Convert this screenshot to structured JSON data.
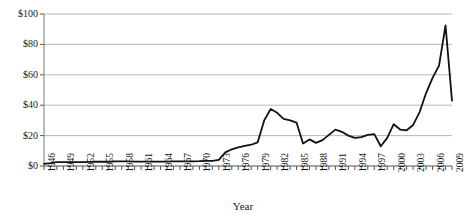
{
  "chart_data": {
    "type": "line",
    "title": "",
    "xlabel": "Year",
    "ylabel": "",
    "ylim": [
      0,
      100
    ],
    "xlim": [
      1946,
      2009
    ],
    "grid": "horizontal",
    "legend": "none",
    "y_ticks": [
      0,
      20,
      40,
      60,
      80,
      100
    ],
    "y_tick_labels": [
      "$0",
      "$20",
      "$40",
      "$60",
      "$80",
      "$100"
    ],
    "x_tick_labels": [
      "1946",
      "1949",
      "1952",
      "1955",
      "1958",
      "1961",
      "1964",
      "1967",
      "1970",
      "1973",
      "1976",
      "1979",
      "1982",
      "1985",
      "1988",
      "1991",
      "1994",
      "1997",
      "2000",
      "2003",
      "2006",
      "2009"
    ],
    "line_color": "#111111",
    "series": [
      {
        "name": "Price",
        "x": [
          1946,
          1947,
          1948,
          1949,
          1950,
          1951,
          1952,
          1953,
          1954,
          1955,
          1956,
          1957,
          1958,
          1959,
          1960,
          1961,
          1962,
          1963,
          1964,
          1965,
          1966,
          1967,
          1968,
          1969,
          1970,
          1971,
          1972,
          1973,
          1974,
          1975,
          1976,
          1977,
          1978,
          1979,
          1980,
          1981,
          1982,
          1983,
          1984,
          1985,
          1986,
          1987,
          1988,
          1989,
          1990,
          1991,
          1992,
          1993,
          1994,
          1995,
          1996,
          1997,
          1998,
          1999,
          2000,
          2001,
          2002,
          2003,
          2004,
          2005,
          2006,
          2007,
          2008,
          2009
        ],
        "values": [
          1.4,
          1.9,
          2.6,
          2.5,
          2.5,
          2.5,
          2.5,
          2.7,
          2.8,
          2.8,
          2.8,
          3.1,
          3.0,
          3.0,
          2.9,
          2.9,
          2.9,
          2.9,
          2.9,
          2.9,
          3.0,
          3.1,
          3.1,
          3.1,
          3.2,
          3.4,
          3.4,
          4.0,
          9.0,
          11.0,
          12.2,
          13.2,
          14.0,
          15.6,
          30.0,
          37.5,
          35.0,
          31.0,
          30.0,
          28.5,
          14.8,
          17.5,
          15.2,
          17.0,
          20.5,
          23.9,
          22.5,
          20.0,
          18.5,
          19.0,
          20.5,
          21.0,
          13.0,
          18.5,
          27.5,
          24.0,
          23.5,
          27.0,
          35.5,
          48.0,
          58.0,
          66.0,
          92.5,
          43.0
        ]
      }
    ]
  },
  "axis": {
    "x_title": "Year"
  }
}
